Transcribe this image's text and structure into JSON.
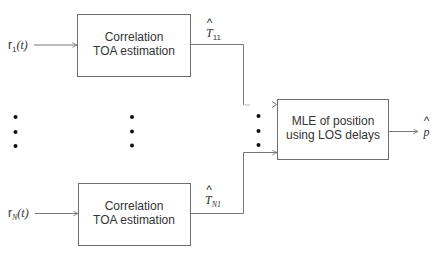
{
  "diagram": {
    "title": "",
    "blocks": [
      {
        "id": "corr-1",
        "lines": [
          "Correlation",
          "TOA estimation"
        ]
      },
      {
        "id": "corr-N",
        "lines": [
          "Correlation",
          "TOA estimation"
        ]
      },
      {
        "id": "mle",
        "lines": [
          "MLE of position",
          "using LOS delays"
        ]
      }
    ],
    "inputs": [
      {
        "id": "r1",
        "base": "r",
        "sub": "1",
        "arg": "(t)"
      },
      {
        "id": "rN",
        "base": "r",
        "sub": "N",
        "arg": "(t)"
      }
    ],
    "intermediate": [
      {
        "id": "T11",
        "base": "T",
        "hat": "^",
        "sub": "11"
      },
      {
        "id": "TN1",
        "base": "T",
        "hat": "^",
        "sub": "N1"
      }
    ],
    "output": {
      "id": "p",
      "base": "p",
      "hat": "^"
    },
    "ellipsis_glyph": "•",
    "colors": {
      "stroke": "#6e6e6e",
      "text": "#333333",
      "dot": "#111111"
    }
  }
}
